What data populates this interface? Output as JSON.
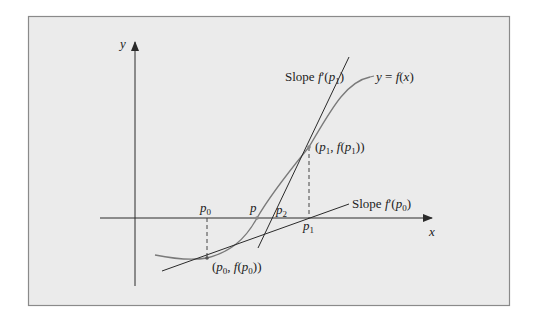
{
  "figure": {
    "background": "#ebebeb",
    "frame_color": "#888888",
    "ink_color": "#2a2a2a",
    "curve_color": "#7a7a7a"
  },
  "axes": {
    "x_label": "x",
    "y_label": "y"
  },
  "curve": {
    "label": "y = f(x)"
  },
  "tangents": {
    "p0": {
      "label": "Slope f′(p0)",
      "label_prefix": "Slope f′(",
      "label_var": "p",
      "label_sub": "0",
      "label_suffix": ")"
    },
    "p1": {
      "label": "Slope f′(p1)",
      "label_prefix": "Slope f′(",
      "label_var": "p",
      "label_sub": "1",
      "label_suffix": ")"
    }
  },
  "points": {
    "p0_axis": {
      "var": "p",
      "sub": "0"
    },
    "p_axis": {
      "var": "p"
    },
    "p2_axis": {
      "var": "p",
      "sub": "2"
    },
    "p1_axis": {
      "var": "p",
      "sub": "1"
    },
    "p0_curve": {
      "label": "(p0, f(p0))",
      "open": "(",
      "var": "p",
      "sub": "0",
      "mid": ", f(",
      "close": "))"
    },
    "p1_curve": {
      "label": "(p1, f(p1))",
      "open": "(",
      "var": "p",
      "sub": "1",
      "mid": ", f(",
      "close": "))"
    }
  }
}
